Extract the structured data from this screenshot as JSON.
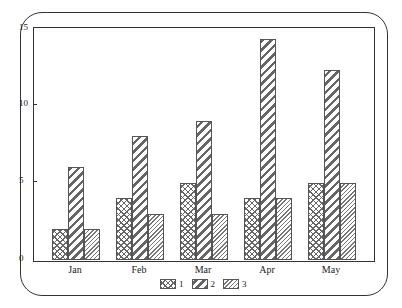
{
  "chart_data": {
    "type": "bar",
    "title": "",
    "xlabel": "",
    "ylabel": "",
    "categories": [
      "Jan",
      "Feb",
      "Mar",
      "Apr",
      "May"
    ],
    "series": [
      {
        "name": "1",
        "pattern": "crosshatch",
        "values": [
          2,
          4,
          5,
          4,
          5
        ]
      },
      {
        "name": "2",
        "pattern": "wide-diagonal",
        "values": [
          6,
          8,
          9,
          14.3,
          12.3
        ]
      },
      {
        "name": "3",
        "pattern": "fine-diagonal",
        "values": [
          2,
          3,
          3,
          4,
          5
        ]
      }
    ],
    "ylim": [
      0,
      15
    ],
    "yticks": [
      "0",
      "5",
      "10",
      "15"
    ],
    "grid": false,
    "legend_position": "bottom-center"
  },
  "axis": {
    "yticks": [
      {
        "label": "0",
        "value": 0
      },
      {
        "label": "5",
        "value": 5
      },
      {
        "label": "10",
        "value": 10
      },
      {
        "label": "15",
        "value": 15
      }
    ]
  },
  "legend": {
    "items": [
      {
        "label": "1"
      },
      {
        "label": "2"
      },
      {
        "label": "3"
      }
    ]
  },
  "xlabels": [
    "Jan",
    "Feb",
    "Mar",
    "Apr",
    "May"
  ]
}
